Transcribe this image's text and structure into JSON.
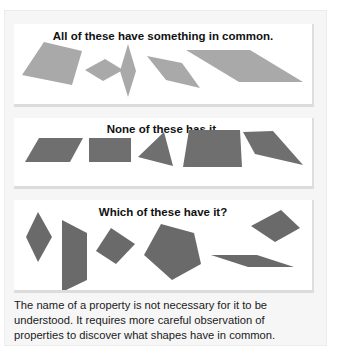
{
  "cards": [
    {
      "title": "All of these have something in common.",
      "fill": "#a9a9a9",
      "shapes": [
        {
          "name": "square-tilted",
          "points": "30,18 68,27 58,61 8,51"
        },
        {
          "name": "rhombus-small",
          "points": "71,46 91,35 109,46 89,57"
        },
        {
          "name": "rhombus-tall",
          "points": "114,20 122,47 114,73 106,47"
        },
        {
          "name": "rhombus-medium",
          "points": "133,32 168,39 186,64 152,56"
        },
        {
          "name": "parallelogram-wide",
          "points": "172,26 236,26 289,58 225,58"
        }
      ]
    },
    {
      "title": "None of these has it.",
      "fill": "#6f6f6f",
      "shapes": [
        {
          "name": "parallelogram",
          "points": "25,20 69,20 56,44 11,44"
        },
        {
          "name": "rectangle",
          "points": "75,20 117,20 117,44 75,44"
        },
        {
          "name": "triangle",
          "points": "150,14 159,48 124,39"
        },
        {
          "name": "trapezoid",
          "points": "175,12 226,12 228,49 169,49"
        },
        {
          "name": "quadrilateral",
          "points": "229,14 259,13 289,47 241,36"
        }
      ]
    },
    {
      "title": "Which of these have it?",
      "fill": "#6a6a6a",
      "shapes": [
        {
          "name": "rhombus-vertical",
          "points": "24,12 38,37 24,62 12,37"
        },
        {
          "name": "trapezoid-vertical",
          "points": "48,20 73,33 73,80 48,92"
        },
        {
          "name": "square-tilted",
          "points": "97,28 121,44 102,64 82,51"
        },
        {
          "name": "pentagon",
          "points": "147,24 180,33 187,64 158,80 130,55"
        },
        {
          "name": "rhombus-right",
          "points": "267,10 286,28 261,42 237,26"
        },
        {
          "name": "parallelogram-thin",
          "points": "197,55 243,55 280,67 234,67"
        }
      ]
    }
  ],
  "caption": "The name of a property is not necessary for it to be understood. It requires more careful observation of properties to discover what shapes have in common."
}
